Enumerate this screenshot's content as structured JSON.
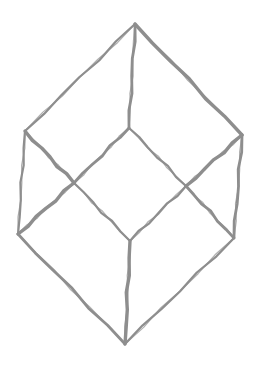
{
  "stroke_color": "#8e8e8e",
  "background_color": "#ffffff",
  "vertices": {
    "top": "apex",
    "left": "upper-left",
    "inner_top": "upper-center",
    "right": "upper-right",
    "x_left": "left-crossing",
    "x_right": "right-crossing",
    "lower_left": "lower-left",
    "inner_bottom": "lower-center",
    "lower_right": "lower-right",
    "bottom": "bottom-apex"
  },
  "edges": [
    [
      "top",
      "left"
    ],
    [
      "top",
      "inner_top"
    ],
    [
      "top",
      "right"
    ],
    [
      "left",
      "lower_left"
    ],
    [
      "right",
      "lower_right"
    ],
    [
      "left",
      "x_left"
    ],
    [
      "x_left",
      "inner_bottom"
    ],
    [
      "inner_top",
      "x_left"
    ],
    [
      "x_left",
      "lower_left"
    ],
    [
      "inner_top",
      "x_right"
    ],
    [
      "x_right",
      "lower_right"
    ],
    [
      "right",
      "x_right"
    ],
    [
      "x_right",
      "inner_bottom"
    ],
    [
      "lower_left",
      "bottom"
    ],
    [
      "inner_bottom",
      "bottom"
    ],
    [
      "lower_right",
      "bottom"
    ]
  ]
}
